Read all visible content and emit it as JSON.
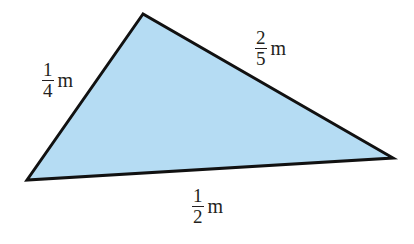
{
  "diagram": {
    "shape": "triangle",
    "fill_color": "#b5dcf3",
    "stroke_color": "#111111",
    "vertices": {
      "top": [
        143,
        14
      ],
      "left": [
        27,
        180
      ],
      "right": [
        393,
        158
      ]
    },
    "sides": [
      {
        "id": "left_side",
        "numerator": "1",
        "denominator": "4",
        "unit": "m"
      },
      {
        "id": "right_side",
        "numerator": "2",
        "denominator": "5",
        "unit": "m"
      },
      {
        "id": "bottom_side",
        "numerator": "1",
        "denominator": "2",
        "unit": "m"
      }
    ]
  }
}
